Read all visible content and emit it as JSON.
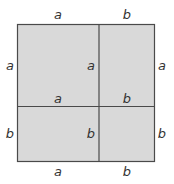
{
  "diagram": {
    "type": "square-partition",
    "colors": {
      "fill": "#d9d9d9",
      "stroke": "#4a4a4a",
      "label": "#333333"
    },
    "top_labels": [
      "a",
      "b"
    ],
    "bottom_labels": [
      "a",
      "b"
    ],
    "left_labels": [
      "a",
      "b"
    ],
    "right_labels": [
      "a",
      "b"
    ],
    "inner_vertical_labels": [
      "a",
      "b"
    ],
    "inner_horizontal_labels": [
      "a",
      "b"
    ]
  }
}
